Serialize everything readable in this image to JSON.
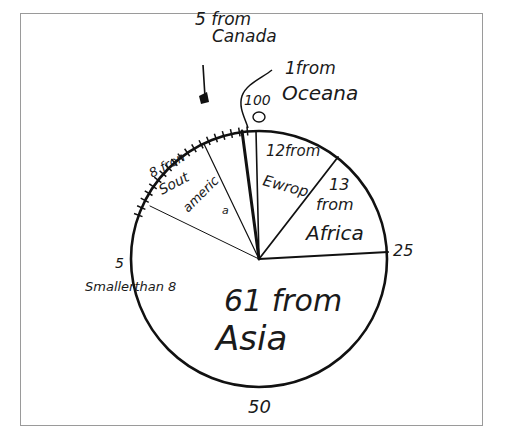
{
  "chart_data": {
    "type": "pie",
    "title": "",
    "style": "hand-drawn",
    "scale": {
      "total": 100,
      "markers": [
        {
          "label": "0",
          "position": "top"
        },
        {
          "label": "25",
          "position": "right"
        },
        {
          "label": "50",
          "position": "bottom"
        }
      ]
    },
    "slices": [
      {
        "label": "12 from Europe",
        "region": "Europe",
        "value": 12
      },
      {
        "label": "13 from Africa",
        "region": "Africa",
        "value": 13
      },
      {
        "label": "61 from Asia",
        "region": "Asia",
        "value": 61
      },
      {
        "label": "8 from South America",
        "region": "South America",
        "value": 8
      },
      {
        "label": "5 from Canada",
        "region": "Canada",
        "value": 5
      },
      {
        "label": "1 from Oceana",
        "region": "Oceana",
        "value": 1
      }
    ],
    "annotations": [
      "5",
      "Smaller than 8",
      "100",
      "0",
      "25",
      "50"
    ]
  },
  "labels": {
    "europe_num": "12from",
    "europe_name": "Ewrop",
    "africa_num": "13",
    "africa_from": "from",
    "africa_name": "Africa",
    "asia_line1": "61 from",
    "asia_name": "Asia",
    "sa_line1": "8 fron",
    "sa_line2": "Sout",
    "sa_line3": "americ",
    "sa_line4": "a",
    "canada_line1": "5 from",
    "canada_line2": "Canada",
    "oceana_line1": "1from",
    "oceana_line2": "Oceana",
    "marker_0": "0",
    "marker_100": "100",
    "marker_25": "25",
    "marker_50": "50",
    "marker_5": "5",
    "smaller_than": "Smallerthan 8"
  }
}
